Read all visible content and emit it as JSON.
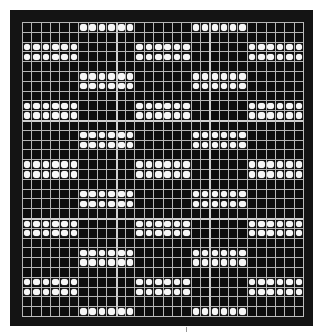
{
  "pattern": {
    "rows": 30,
    "cols": 30,
    "period_rows": 6,
    "row_roles": [
      "mid",
      "empty",
      "left",
      "left",
      "empty",
      "mid"
    ],
    "left_groups": [
      [
        0,
        5
      ],
      [
        12,
        17
      ],
      [
        24,
        29
      ]
    ],
    "mid_groups": [
      [
        6,
        11
      ],
      [
        18,
        23
      ]
    ],
    "heavy_lines": {
      "cols": [
        10,
        20
      ],
      "rows": [
        10,
        20
      ]
    }
  },
  "colors": {
    "frame": "#141414",
    "cell_bg": "#0d0d0d",
    "grid_line": "#b5b5b5",
    "dot": "#f7f7f7"
  }
}
